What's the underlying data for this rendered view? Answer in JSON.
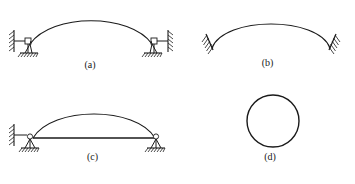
{
  "figure": {
    "background_color": "#ffffff",
    "ink_color": "#1a1a1a",
    "width": 355,
    "height": 184
  },
  "panels": [
    {
      "id": "a",
      "caption": "(a)",
      "description": "Shallow two-hinged arch on bracketed wall supports",
      "arch": {
        "type": "shallow-arch",
        "start": [
          30,
          44
        ],
        "peak": [
          91,
          14
        ],
        "end": [
          152,
          44
        ],
        "rise": 30,
        "span": 122
      },
      "supports": [
        {
          "name": "left-wall-bracket-support",
          "side": "left",
          "wall": "vertical-hatched",
          "base": "hatched-ground-pad"
        },
        {
          "name": "right-wall-bracket-support",
          "side": "right",
          "wall": "vertical-hatched",
          "base": "hatched-ground-pad"
        }
      ]
    },
    {
      "id": "b",
      "caption": "(b)",
      "description": "Steep arch with inclined fixed supports",
      "arch": {
        "type": "steep-arch",
        "start": [
          32,
          48
        ],
        "peak": [
          91,
          20
        ],
        "end": [
          150,
          48
        ],
        "rise": 28,
        "span": 118
      },
      "supports": [
        {
          "name": "left-inclined-fixed-support",
          "side": "left",
          "wall": "inclined-hatched",
          "base": "none"
        },
        {
          "name": "right-inclined-fixed-support",
          "side": "right",
          "wall": "inclined-hatched",
          "base": "none"
        }
      ]
    },
    {
      "id": "c",
      "caption": "(c)",
      "description": "Tied arch with horizontal tie rod between springing points",
      "arch": {
        "type": "tied-arch",
        "start": [
          33,
          46
        ],
        "peak": [
          94,
          18
        ],
        "end": [
          155,
          46
        ],
        "rise": 28,
        "span": 122
      },
      "tie_rod": {
        "name": "horizontal-tie-rod",
        "start": [
          33,
          46
        ],
        "end": [
          155,
          46
        ]
      },
      "supports": [
        {
          "name": "left-wall-bracket-support",
          "side": "left",
          "wall": "vertical-hatched",
          "base": "hatched-ground-pad"
        },
        {
          "name": "right-pin-support",
          "side": "right",
          "wall": "none",
          "base": "hatched-ground-pad"
        }
      ]
    },
    {
      "id": "d",
      "caption": "(d)",
      "description": "Closed circular ring",
      "ring": {
        "type": "circle",
        "center": [
          88,
          29
        ],
        "radius": 26
      },
      "supports": []
    }
  ]
}
